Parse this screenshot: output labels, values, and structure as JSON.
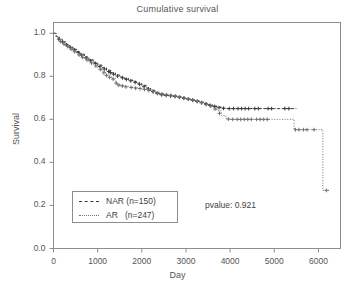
{
  "chart_data": {
    "type": "line",
    "title": "Cumulative survival",
    "xlabel": "Day",
    "ylabel": "Survival",
    "xlim": [
      0,
      6500
    ],
    "ylim": [
      0.0,
      1.05
    ],
    "xticks": [
      0,
      1000,
      2000,
      3000,
      4000,
      5000,
      6000
    ],
    "xtick_labels": [
      "0",
      "1000",
      "2000",
      "3000",
      "4000",
      "5000",
      "6000"
    ],
    "yticks": [
      0.0,
      0.2,
      0.4,
      0.6,
      0.8,
      1.0
    ],
    "ytick_labels": [
      "0.0",
      "0.2",
      "0.4",
      "0.6",
      "0.8",
      "1.0"
    ],
    "grid": false,
    "legend_position": "lower left",
    "annotations": [
      {
        "name": "pvalue",
        "text": "pvalue: 0.921",
        "x": 3600,
        "y": 0.18
      }
    ],
    "series": [
      {
        "name": "NAR",
        "label": "NAR (n=150)",
        "n": 150,
        "linestyle": "dashed",
        "color": "#3b3b3b",
        "points": [
          [
            0,
            1.0
          ],
          [
            60,
            0.985
          ],
          [
            130,
            0.972
          ],
          [
            200,
            0.96
          ],
          [
            280,
            0.948
          ],
          [
            360,
            0.936
          ],
          [
            440,
            0.926
          ],
          [
            520,
            0.915
          ],
          [
            600,
            0.903
          ],
          [
            700,
            0.89
          ],
          [
            800,
            0.877
          ],
          [
            900,
            0.865
          ],
          [
            1000,
            0.852
          ],
          [
            1100,
            0.84
          ],
          [
            1200,
            0.828
          ],
          [
            1300,
            0.816
          ],
          [
            1400,
            0.806
          ],
          [
            1500,
            0.797
          ],
          [
            1600,
            0.79
          ],
          [
            1700,
            0.782
          ],
          [
            1800,
            0.775
          ],
          [
            1900,
            0.768
          ],
          [
            2000,
            0.758
          ],
          [
            2100,
            0.746
          ],
          [
            2200,
            0.735
          ],
          [
            2300,
            0.725
          ],
          [
            2400,
            0.716
          ],
          [
            2500,
            0.712
          ],
          [
            2600,
            0.71
          ],
          [
            2700,
            0.708
          ],
          [
            2800,
            0.704
          ],
          [
            2900,
            0.7
          ],
          [
            3000,
            0.696
          ],
          [
            3100,
            0.691
          ],
          [
            3200,
            0.686
          ],
          [
            3300,
            0.68
          ],
          [
            3400,
            0.674
          ],
          [
            3500,
            0.668
          ],
          [
            3600,
            0.662
          ],
          [
            3700,
            0.657
          ],
          [
            3800,
            0.652
          ],
          [
            3900,
            0.65
          ],
          [
            4100,
            0.65
          ],
          [
            4300,
            0.65
          ],
          [
            4500,
            0.65
          ],
          [
            4700,
            0.65
          ],
          [
            5000,
            0.65
          ],
          [
            5300,
            0.65
          ],
          [
            5500,
            0.65
          ]
        ],
        "censor_marks": [
          [
            120,
            0.973
          ],
          [
            210,
            0.959
          ],
          [
            300,
            0.946
          ],
          [
            380,
            0.935
          ],
          [
            470,
            0.923
          ],
          [
            560,
            0.91
          ],
          [
            640,
            0.899
          ],
          [
            740,
            0.885
          ],
          [
            840,
            0.872
          ],
          [
            950,
            0.859
          ],
          [
            1050,
            0.846
          ],
          [
            1150,
            0.834
          ],
          [
            1250,
            0.822
          ],
          [
            1290,
            0.817
          ],
          [
            1360,
            0.81
          ],
          [
            1450,
            0.801
          ],
          [
            1560,
            0.793
          ],
          [
            1650,
            0.786
          ],
          [
            1750,
            0.779
          ],
          [
            1850,
            0.772
          ],
          [
            1950,
            0.763
          ],
          [
            2050,
            0.752
          ],
          [
            2150,
            0.741
          ],
          [
            2250,
            0.73
          ],
          [
            2350,
            0.72
          ],
          [
            2450,
            0.714
          ],
          [
            2550,
            0.711
          ],
          [
            2650,
            0.709
          ],
          [
            2750,
            0.706
          ],
          [
            2850,
            0.702
          ],
          [
            2950,
            0.698
          ],
          [
            3050,
            0.694
          ],
          [
            3150,
            0.689
          ],
          [
            3250,
            0.683
          ],
          [
            3350,
            0.677
          ],
          [
            3450,
            0.671
          ],
          [
            3550,
            0.665
          ],
          [
            3650,
            0.66
          ],
          [
            3750,
            0.654
          ],
          [
            3850,
            0.651
          ],
          [
            3980,
            0.65
          ],
          [
            4080,
            0.65
          ],
          [
            4180,
            0.65
          ],
          [
            4260,
            0.65
          ],
          [
            4340,
            0.65
          ],
          [
            4420,
            0.65
          ],
          [
            4560,
            0.65
          ],
          [
            4640,
            0.65
          ],
          [
            4860,
            0.65
          ],
          [
            4940,
            0.65
          ],
          [
            5240,
            0.65
          ],
          [
            5330,
            0.65
          ]
        ]
      },
      {
        "name": "AR",
        "label": "AR   (n=247)",
        "n": 247,
        "linestyle": "dotted",
        "color": "#6f6f6f",
        "points": [
          [
            0,
            1.0
          ],
          [
            60,
            0.982
          ],
          [
            130,
            0.968
          ],
          [
            200,
            0.955
          ],
          [
            280,
            0.943
          ],
          [
            360,
            0.931
          ],
          [
            440,
            0.92
          ],
          [
            520,
            0.908
          ],
          [
            600,
            0.896
          ],
          [
            700,
            0.883
          ],
          [
            800,
            0.869
          ],
          [
            900,
            0.855
          ],
          [
            1000,
            0.84
          ],
          [
            1100,
            0.824
          ],
          [
            1180,
            0.808
          ],
          [
            1250,
            0.798
          ],
          [
            1320,
            0.79
          ],
          [
            1400,
            0.772
          ],
          [
            1450,
            0.762
          ],
          [
            1520,
            0.757
          ],
          [
            1600,
            0.753
          ],
          [
            1700,
            0.75
          ],
          [
            1800,
            0.747
          ],
          [
            1900,
            0.744
          ],
          [
            2000,
            0.742
          ],
          [
            2100,
            0.737
          ],
          [
            2200,
            0.732
          ],
          [
            2300,
            0.726
          ],
          [
            2400,
            0.72
          ],
          [
            2500,
            0.716
          ],
          [
            2600,
            0.713
          ],
          [
            2700,
            0.71
          ],
          [
            2800,
            0.706
          ],
          [
            2900,
            0.702
          ],
          [
            3000,
            0.697
          ],
          [
            3100,
            0.692
          ],
          [
            3200,
            0.687
          ],
          [
            3300,
            0.681
          ],
          [
            3400,
            0.674
          ],
          [
            3500,
            0.666
          ],
          [
            3600,
            0.656
          ],
          [
            3700,
            0.64
          ],
          [
            3800,
            0.618
          ],
          [
            3900,
            0.604
          ],
          [
            4000,
            0.6
          ],
          [
            4200,
            0.6
          ],
          [
            4500,
            0.6
          ],
          [
            4800,
            0.6
          ],
          [
            5100,
            0.6
          ],
          [
            5400,
            0.6
          ],
          [
            5450,
            0.552
          ],
          [
            5600,
            0.552
          ],
          [
            5800,
            0.552
          ],
          [
            6000,
            0.552
          ],
          [
            6050,
            0.552
          ],
          [
            6100,
            0.27
          ],
          [
            6250,
            0.27
          ]
        ],
        "censor_marks": [
          [
            160,
            0.962
          ],
          [
            240,
            0.949
          ],
          [
            320,
            0.938
          ],
          [
            400,
            0.926
          ],
          [
            480,
            0.914
          ],
          [
            580,
            0.899
          ],
          [
            660,
            0.888
          ],
          [
            760,
            0.876
          ],
          [
            860,
            0.862
          ],
          [
            960,
            0.848
          ],
          [
            1060,
            0.832
          ],
          [
            1140,
            0.816
          ],
          [
            1200,
            0.804
          ],
          [
            1270,
            0.795
          ],
          [
            1350,
            0.787
          ],
          [
            1420,
            0.768
          ],
          [
            1480,
            0.759
          ],
          [
            1560,
            0.755
          ],
          [
            1640,
            0.751
          ],
          [
            1760,
            0.748
          ],
          [
            1860,
            0.745
          ],
          [
            1960,
            0.743
          ],
          [
            2060,
            0.739
          ],
          [
            2160,
            0.734
          ],
          [
            2260,
            0.728
          ],
          [
            2360,
            0.722
          ],
          [
            2460,
            0.718
          ],
          [
            2560,
            0.714
          ],
          [
            2660,
            0.711
          ],
          [
            2760,
            0.708
          ],
          [
            2860,
            0.704
          ],
          [
            2960,
            0.699
          ],
          [
            3060,
            0.694
          ],
          [
            3160,
            0.689
          ],
          [
            3260,
            0.684
          ],
          [
            3360,
            0.678
          ],
          [
            3460,
            0.67
          ],
          [
            3560,
            0.661
          ],
          [
            3660,
            0.648
          ],
          [
            3760,
            0.628
          ],
          [
            3960,
            0.601
          ],
          [
            4060,
            0.6
          ],
          [
            4160,
            0.6
          ],
          [
            4240,
            0.6
          ],
          [
            4320,
            0.6
          ],
          [
            4400,
            0.6
          ],
          [
            4480,
            0.6
          ],
          [
            4600,
            0.6
          ],
          [
            4680,
            0.6
          ],
          [
            4760,
            0.6
          ],
          [
            4840,
            0.6
          ],
          [
            5480,
            0.552
          ],
          [
            5560,
            0.552
          ],
          [
            5660,
            0.552
          ],
          [
            5740,
            0.552
          ],
          [
            5900,
            0.552
          ],
          [
            6180,
            0.27
          ]
        ]
      }
    ]
  },
  "legend": {
    "items": [
      {
        "label": "NAR (n=150)",
        "style": "dashed"
      },
      {
        "label": "AR   (n=247)",
        "style": "dotted"
      }
    ]
  }
}
